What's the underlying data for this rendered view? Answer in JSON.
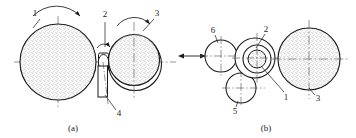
{
  "figure": {
    "type": "mechanical-engineering-line-drawing",
    "background_color": "#ffffff",
    "line_color": "#1a1a1a",
    "stipple_color": "#8a8a8a",
    "centerline_color": "#555555",
    "captions": [
      {
        "id": "caption-a",
        "text": "(a)",
        "x": 73,
        "y": 129
      },
      {
        "id": "caption-b",
        "text": "(b)",
        "x": 266,
        "y": 129
      }
    ],
    "view_a": {
      "name": "view-a",
      "callouts": [
        {
          "id": "callout-1a",
          "text": "1",
          "x": 37,
          "y": 15
        },
        {
          "id": "callout-2a",
          "text": "2",
          "x": 106,
          "y": 16
        },
        {
          "id": "callout-3a",
          "text": "3",
          "x": 156,
          "y": 15
        },
        {
          "id": "callout-4a",
          "text": "4",
          "x": 118,
          "y": 114
        }
      ],
      "parts": [
        {
          "id": "roller-1a",
          "label": "1",
          "shape": "circle",
          "cx": 58,
          "cy": 62,
          "r": 38,
          "fill": "stipple",
          "note": "large driven cylinder"
        },
        {
          "id": "roller-2a",
          "label": "2",
          "shape": "small-roller",
          "cx": 103,
          "cy": 62,
          "rx": 5,
          "ry": 7,
          "fill": "none",
          "note": "small nip roller"
        },
        {
          "id": "roller-3a",
          "label": "3",
          "shape": "circle-with-sleeve",
          "cx": 134,
          "cy": 62,
          "r": 26,
          "fill": "stipple",
          "note": "cylinder with outer belt/sleeve"
        },
        {
          "id": "blade-4a",
          "label": "4",
          "shape": "rectangle",
          "x": 98,
          "y": 66,
          "w": 9,
          "h": 31,
          "fill": "none",
          "note": "doctor blade / guide plate"
        }
      ],
      "rotation_arrows": [
        {
          "id": "rotation-arrow-1a",
          "over": "roller-1a",
          "direction": "clockwise"
        },
        {
          "id": "rotation-arrow-2a",
          "over": "roller-2a",
          "direction": "clockwise"
        },
        {
          "id": "rotation-arrow-3a",
          "over": "roller-3a",
          "direction": "clockwise"
        }
      ]
    },
    "view_b": {
      "name": "view-b",
      "callouts": [
        {
          "id": "callout-6b",
          "text": "6",
          "x": 213,
          "y": 32
        },
        {
          "id": "callout-2b",
          "text": "2",
          "x": 265,
          "y": 31
        },
        {
          "id": "callout-1b",
          "text": "1",
          "x": 285,
          "y": 96
        },
        {
          "id": "callout-5b",
          "text": "5",
          "x": 236,
          "y": 110
        },
        {
          "id": "callout-3b",
          "text": "3",
          "x": 316,
          "y": 97
        }
      ],
      "parts": [
        {
          "id": "roller-6b",
          "label": "6",
          "shape": "circle",
          "cx": 221,
          "cy": 56,
          "r": 16,
          "fill": "none"
        },
        {
          "id": "roller-outer-2b",
          "label": "2",
          "shape": "circle",
          "cx": 255,
          "cy": 58,
          "r": 20,
          "fill": "none"
        },
        {
          "id": "roller-mid-1b",
          "label": "1",
          "shape": "circle",
          "cx": 257,
          "cy": 59,
          "r": 14,
          "fill": "none"
        },
        {
          "id": "roller-inner-1b",
          "label": "1",
          "shape": "circle",
          "cx": 257,
          "cy": 59,
          "r": 9,
          "fill": "stipple"
        },
        {
          "id": "roller-5b",
          "label": "5",
          "shape": "circle",
          "cx": 241,
          "cy": 88,
          "r": 15,
          "fill": "none"
        },
        {
          "id": "roller-3b",
          "label": "3",
          "shape": "circle",
          "cx": 309,
          "cy": 59,
          "r": 31,
          "fill": "stipple"
        }
      ],
      "feed_arrow": {
        "id": "feed-arrow",
        "x1": 181,
        "x2": 207,
        "y": 56,
        "direction": "double-headed-horizontal"
      }
    }
  }
}
